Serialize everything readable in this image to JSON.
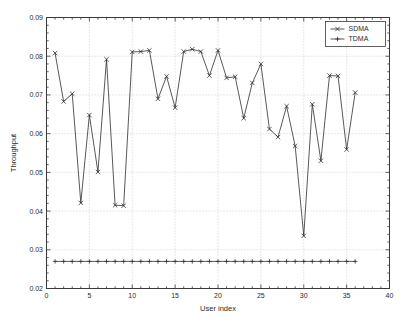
{
  "chart_data": {
    "type": "line",
    "title": "",
    "xlabel": "User index",
    "ylabel": "Throughput",
    "xlim": [
      0,
      40
    ],
    "ylim": [
      0.02,
      0.09
    ],
    "xticks": [
      0,
      5,
      10,
      15,
      20,
      25,
      30,
      35,
      40
    ],
    "xtick_labels": [
      "0",
      "5",
      "10",
      "15",
      "20",
      "25",
      "30",
      "35",
      "40"
    ],
    "yticks": [
      0.02,
      0.03,
      0.04,
      0.05,
      0.06,
      0.07,
      0.08,
      0.09
    ],
    "ytick_labels": [
      "0.02",
      "0.03",
      "0.04",
      "0.05",
      "0.06",
      "0.07",
      "0.08",
      "0.09"
    ],
    "grid": true,
    "legend_position": "top-right",
    "x": [
      1,
      2,
      3,
      4,
      5,
      6,
      7,
      8,
      9,
      10,
      11,
      12,
      13,
      14,
      15,
      16,
      17,
      18,
      19,
      20,
      21,
      22,
      23,
      24,
      25,
      26,
      27,
      28,
      29,
      30,
      31,
      32,
      33,
      34,
      35,
      36
    ],
    "series": [
      {
        "name": "SDMA",
        "marker": "x",
        "color": "#2e2e2e",
        "values": [
          0.0808,
          0.0683,
          0.0703,
          0.0421,
          0.0648,
          0.0501,
          0.0792,
          0.0415,
          0.0414,
          0.0811,
          0.0812,
          0.0815,
          0.069,
          0.0748,
          0.0667,
          0.0812,
          0.0818,
          0.0812,
          0.075,
          0.0815,
          0.0744,
          0.0747,
          0.064,
          0.0731,
          0.078,
          0.0612,
          0.0591,
          0.0671,
          0.0568,
          0.0336,
          0.0676,
          0.053,
          0.075,
          0.0749,
          0.0559,
          0.0706
        ]
      },
      {
        "name": "TDMA",
        "marker": "+",
        "color": "#2e2e2e",
        "values": [
          0.027,
          0.027,
          0.027,
          0.027,
          0.027,
          0.027,
          0.027,
          0.027,
          0.027,
          0.027,
          0.027,
          0.027,
          0.027,
          0.027,
          0.027,
          0.027,
          0.027,
          0.027,
          0.027,
          0.027,
          0.027,
          0.027,
          0.027,
          0.027,
          0.027,
          0.027,
          0.027,
          0.027,
          0.027,
          0.027,
          0.027,
          0.027,
          0.027,
          0.027,
          0.027,
          0.027
        ]
      }
    ]
  },
  "legend": {
    "entries": [
      {
        "label": "SDMA"
      },
      {
        "label": "TDMA"
      }
    ]
  }
}
